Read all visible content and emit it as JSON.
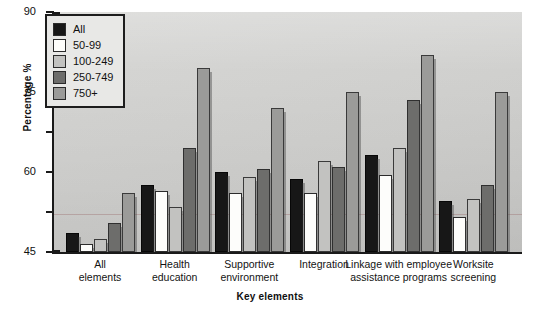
{
  "chart_data": {
    "type": "bar",
    "title": "",
    "xlabel": "Key elements",
    "ylabel": "Percentage %",
    "ylim": [
      0,
      90
    ],
    "yticks": [
      0,
      15,
      30,
      45,
      60,
      75,
      90
    ],
    "grid": false,
    "legend_position": "top-left",
    "categories": [
      "All elements",
      "Health education",
      "Supportive environment",
      "Integration",
      "Linkage with employee assistance programs",
      "Worksite screening"
    ],
    "series": [
      {
        "name": "All",
        "color": "#171717",
        "values": [
          7,
          25,
          30,
          27.5,
          36.5,
          19
        ]
      },
      {
        "name": "50-99",
        "color": "#fdfdfb",
        "values": [
          3,
          23,
          22,
          22,
          29,
          13
        ]
      },
      {
        "name": "100-249",
        "color": "#c2c2c0",
        "values": [
          5,
          17,
          28,
          34,
          39,
          20
        ]
      },
      {
        "name": "250-749",
        "color": "#6d6d6b",
        "values": [
          11,
          39,
          31,
          32,
          57,
          25
        ]
      },
      {
        "name": "750+",
        "color": "#9b9b99",
        "values": [
          22,
          69,
          54,
          60,
          74,
          60
        ]
      }
    ]
  },
  "legend": {
    "items": [
      {
        "label": "All"
      },
      {
        "label": "50-99"
      },
      {
        "label": "100-249"
      },
      {
        "label": "250-749"
      },
      {
        "label": "750+"
      }
    ]
  },
  "axis": {
    "y_tick_labels": [
      "90",
      "75",
      "60",
      "45",
      "30",
      "15",
      "0"
    ],
    "y_title": "Percentage %",
    "x_title": "Key elements",
    "x_tick_labels": [
      "All\nelements",
      "Health\neducation",
      "Supportive\nenvironment",
      "Integration",
      "Linkage with employee\nassistance programs",
      "Worksite\nscreening"
    ]
  }
}
